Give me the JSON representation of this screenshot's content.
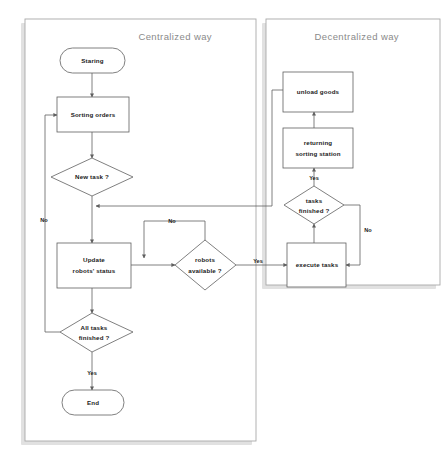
{
  "diagram": {
    "panels": [
      {
        "id": "centralized",
        "title": "Centralized way"
      },
      {
        "id": "decentralized",
        "title": "Decentralized way"
      }
    ],
    "nodes": {
      "start": {
        "label": "Staring",
        "shape": "terminator"
      },
      "sorting_orders": {
        "label": "Sorting orders",
        "shape": "process"
      },
      "new_task": {
        "label": "New task ?",
        "shape": "decision"
      },
      "update_status_line1": {
        "label": "Update",
        "shape": "process"
      },
      "update_status_line2": {
        "label": "robots'  status",
        "shape": "process"
      },
      "robots_available_line1": {
        "label": "robots",
        "shape": "decision"
      },
      "robots_available_line2": {
        "label": "available ?",
        "shape": "decision"
      },
      "all_tasks_line1": {
        "label": "All tasks",
        "shape": "decision"
      },
      "all_tasks_line2": {
        "label": "finished ?",
        "shape": "decision"
      },
      "end": {
        "label": "End",
        "shape": "terminator"
      },
      "unload_goods": {
        "label": "unload goods",
        "shape": "process"
      },
      "returning_line1": {
        "label": "returning",
        "shape": "process"
      },
      "returning_line2": {
        "label": "sorting station",
        "shape": "process"
      },
      "tasks_finished_line1": {
        "label": "tasks",
        "shape": "decision"
      },
      "tasks_finished_line2": {
        "label": "finished ?",
        "shape": "decision"
      },
      "execute_tasks": {
        "label": "execute tasks",
        "shape": "process"
      }
    },
    "edge_labels": {
      "new_task_no": "No",
      "robots_available_no": "No",
      "robots_available_yes": "Yes",
      "all_tasks_yes": "Yes",
      "tasks_finished_yes": "Yes",
      "tasks_finished_no": "No"
    },
    "colors": {
      "shape_stroke": "#5f5f5f",
      "panel_stroke": "#a8a8a8",
      "panel_shadow": "#c9c9c9",
      "title_text": "#8a8a8a",
      "node_text": "#1a1a1a",
      "background": "#ffffff"
    }
  }
}
